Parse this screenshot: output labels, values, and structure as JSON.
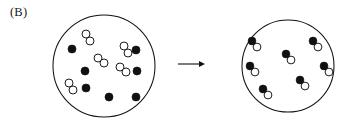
{
  "figure": {
    "panel_label": "(B)",
    "type": "chemical-reaction-particulate-diagram",
    "colors": {
      "stroke": "#111111",
      "filled_atom": "#111111",
      "open_atom": "#ffffff",
      "background": "#ffffff"
    }
  },
  "arrow": {
    "name": "reaction-arrow",
    "direction": "right",
    "x1": 178,
    "x2": 205,
    "y": 64
  },
  "reactant_vessel": {
    "label": "reactants",
    "cx": 104,
    "cy": 66,
    "r": 51,
    "filled_atom_count": 7,
    "open_molecule_count": 5,
    "filled_atoms": [
      {
        "cx": 72,
        "cy": 49,
        "r": 4.0
      },
      {
        "cx": 85,
        "cy": 71,
        "r": 4.0
      },
      {
        "cx": 86,
        "cy": 88,
        "r": 4.0
      },
      {
        "cx": 136,
        "cy": 50,
        "r": 4.0
      },
      {
        "cx": 137,
        "cy": 71,
        "r": 4.0
      },
      {
        "cx": 109,
        "cy": 97,
        "r": 4.0
      },
      {
        "cx": 136,
        "cy": 97,
        "r": 4.0
      }
    ],
    "open_molecules": [
      {
        "x1": 86,
        "y1": 34,
        "x2": 90,
        "y2": 41,
        "r": 4.0
      },
      {
        "x1": 124,
        "y1": 46,
        "x2": 128,
        "y2": 53,
        "r": 4.0
      },
      {
        "x1": 98,
        "y1": 58,
        "x2": 104,
        "y2": 63,
        "r": 4.0
      },
      {
        "x1": 120,
        "y1": 67,
        "x2": 126,
        "y2": 72,
        "r": 4.0
      },
      {
        "x1": 69,
        "y1": 83,
        "x2": 73,
        "y2": 90,
        "r": 4.0
      }
    ]
  },
  "product_vessel": {
    "label": "products",
    "cx": 288,
    "cy": 66,
    "r": 46,
    "molecule_count": 7,
    "molecules": [
      {
        "filled_cx": 252,
        "filled_cy": 41,
        "open_cx": 257,
        "open_cy": 47,
        "r": 3.9
      },
      {
        "filled_cx": 313,
        "filled_cy": 41,
        "open_cx": 318,
        "open_cy": 47,
        "r": 3.9
      },
      {
        "filled_cx": 286,
        "filled_cy": 54,
        "open_cx": 291,
        "open_cy": 60,
        "r": 3.9
      },
      {
        "filled_cx": 250,
        "filled_cy": 66,
        "open_cx": 255,
        "open_cy": 72,
        "r": 3.9
      },
      {
        "filled_cx": 324,
        "filled_cy": 66,
        "open_cx": 329,
        "open_cy": 72,
        "r": 3.9
      },
      {
        "filled_cx": 300,
        "filled_cy": 80,
        "open_cx": 305,
        "open_cy": 86,
        "r": 3.9
      },
      {
        "filled_cx": 263,
        "filled_cy": 89,
        "open_cx": 268,
        "open_cy": 95,
        "r": 3.9
      }
    ]
  }
}
